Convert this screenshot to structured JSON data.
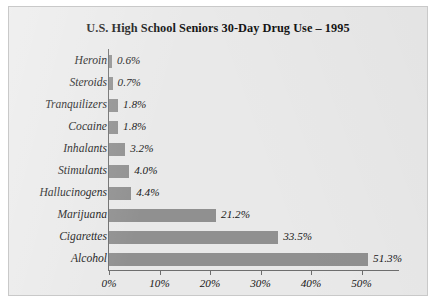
{
  "chart_data": {
    "type": "bar",
    "orientation": "horizontal",
    "title": "U.S. High School Seniors 30-Day Drug Use – 1995",
    "xlabel": "",
    "ylabel": "",
    "xlim": [
      0,
      55
    ],
    "grid": false,
    "legend": false,
    "categories": [
      "Heroin",
      "Steroids",
      "Tranquilizers",
      "Cocaine",
      "Inhalants",
      "Stimulants",
      "Hallucinogens",
      "Marijuana",
      "Cigarettes",
      "Alcohol"
    ],
    "values": [
      0.6,
      0.7,
      1.8,
      1.8,
      3.2,
      4.0,
      4.4,
      21.2,
      33.5,
      51.3
    ],
    "value_labels": [
      "0.6%",
      "0.7%",
      "1.8%",
      "1.8%",
      "3.2%",
      "4.0%",
      "4.4%",
      "21.2%",
      "33.5%",
      "51.3%"
    ],
    "xticks": [
      0,
      10,
      20,
      30,
      40,
      50
    ],
    "xtick_labels": [
      "0%",
      "10%",
      "20%",
      "30%",
      "40%",
      "50%"
    ],
    "colors": {
      "bar": "#909090",
      "background": "#e9e9e9",
      "axis": "#6e6e6e",
      "text": "#161616",
      "border": "#c9c9c9"
    }
  }
}
